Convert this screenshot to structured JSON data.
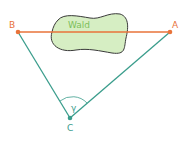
{
  "diagram": {
    "points": {
      "A": {
        "label": "A",
        "x": 170,
        "y": 32
      },
      "B": {
        "label": "B",
        "x": 18,
        "y": 32
      },
      "C": {
        "label": "C",
        "x": 70,
        "y": 118
      }
    },
    "forest_label": "Wald",
    "angle_label": "γ",
    "colors": {
      "segment_AB": "#e8733a",
      "segments_AC_BC": "#3a9d8c",
      "forest_fill": "#d6eec3",
      "forest_stroke": "#3a3a3a",
      "forest_text": "#7cbf5a",
      "point_AB": "#e8733a",
      "point_C": "#3a9d8c"
    }
  }
}
